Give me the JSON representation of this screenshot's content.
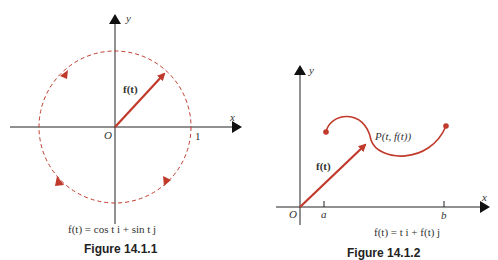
{
  "figures": [
    {
      "caption": "Figure 14.1.1",
      "equation": "f(t) = cos t i + sin t j",
      "axis_x": "x",
      "axis_y": "y",
      "origin": "O",
      "tick_1": "1",
      "vector_label": "f(t)",
      "colors": {
        "curve": "#c0392b",
        "axes": "#222222"
      }
    },
    {
      "caption": "Figure 14.1.2",
      "equation": "f(t) = t i + f(t) j",
      "axis_x": "x",
      "axis_y": "y",
      "origin": "O",
      "tick_a": "a",
      "tick_b": "b",
      "vector_label": "f(t)",
      "point_label": "P(t, f(t))",
      "colors": {
        "curve": "#c0392b",
        "axes": "#222222"
      }
    }
  ]
}
